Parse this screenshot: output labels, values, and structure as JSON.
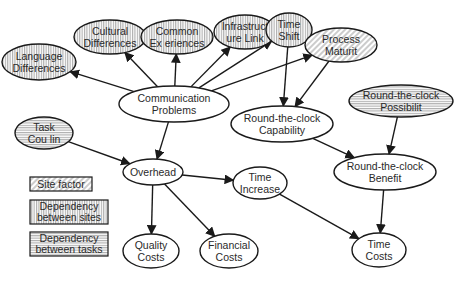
{
  "diagram": {
    "type": "causal-graph",
    "nodes": [
      {
        "id": "language",
        "line1": "Language",
        "line2": "Differences",
        "category": "sites",
        "cx": 39,
        "cy": 62,
        "rx": 37,
        "ry": 18
      },
      {
        "id": "cultural",
        "line1": "Cultural",
        "line2": "Differences",
        "category": "sites",
        "cx": 110,
        "cy": 37,
        "rx": 36,
        "ry": 17
      },
      {
        "id": "common",
        "line1": "Common",
        "line2": "Ex  eriences",
        "category": "sites",
        "cx": 177,
        "cy": 37,
        "rx": 36,
        "ry": 17
      },
      {
        "id": "infra",
        "line1": "Infrastruct",
        "line2": "ure Link",
        "category": "sites",
        "cx": 245,
        "cy": 32,
        "rx": 31,
        "ry": 17
      },
      {
        "id": "timeshift",
        "line1": "Time",
        "line2": "Shift",
        "category": "sites",
        "cx": 289,
        "cy": 30,
        "rx": 23,
        "ry": 17
      },
      {
        "id": "process",
        "line1": "Process",
        "line2": "Maturit",
        "category": "site",
        "cx": 341,
        "cy": 45,
        "rx": 36,
        "ry": 17
      },
      {
        "id": "comm",
        "line1": "Communication",
        "line2": "Problems",
        "category": "plain",
        "cx": 174,
        "cy": 104,
        "rx": 55,
        "ry": 18
      },
      {
        "id": "rtc_cap",
        "line1": "Round-the-clock",
        "line2": "Capability",
        "category": "plain",
        "cx": 282,
        "cy": 124,
        "rx": 51,
        "ry": 18
      },
      {
        "id": "rtc_pos",
        "line1": "Round-the-clock",
        "line2": "Possibilit",
        "category": "tasks",
        "cx": 401,
        "cy": 101,
        "rx": 52,
        "ry": 16
      },
      {
        "id": "task",
        "line1": "Task",
        "line2": "Cou  lin",
        "category": "tasks",
        "cx": 44,
        "cy": 133,
        "rx": 29,
        "ry": 16
      },
      {
        "id": "overhead",
        "line1": "Overhead",
        "line2": "",
        "category": "plain",
        "cx": 153,
        "cy": 172,
        "rx": 30,
        "ry": 13
      },
      {
        "id": "timeinc",
        "line1": "Time",
        "line2": "Increase",
        "category": "plain",
        "cx": 260,
        "cy": 183,
        "rx": 27,
        "ry": 16
      },
      {
        "id": "rtc_ben",
        "line1": "Round-the-clock",
        "line2": "Benefit",
        "category": "plain",
        "cx": 385,
        "cy": 172,
        "rx": 51,
        "ry": 18
      },
      {
        "id": "quality",
        "line1": "Quality",
        "line2": "Costs",
        "category": "plain",
        "cx": 151,
        "cy": 251,
        "rx": 28,
        "ry": 17
      },
      {
        "id": "financial",
        "line1": "Financial",
        "line2": "Costs",
        "category": "plain",
        "cx": 229,
        "cy": 251,
        "rx": 29,
        "ry": 17
      },
      {
        "id": "timecosts",
        "line1": "Time",
        "line2": "Costs",
        "category": "plain",
        "cx": 379,
        "cy": 250,
        "rx": 27,
        "ry": 17
      }
    ],
    "edges": [
      {
        "from": "comm",
        "to": "language"
      },
      {
        "from": "comm",
        "to": "cultural"
      },
      {
        "from": "comm",
        "to": "common"
      },
      {
        "from": "comm",
        "to": "infra"
      },
      {
        "from": "comm",
        "to": "timeshift"
      },
      {
        "from": "comm",
        "to": "process"
      },
      {
        "from": "timeshift",
        "to": "rtc_cap"
      },
      {
        "from": "process",
        "to": "rtc_cap"
      },
      {
        "from": "comm",
        "to": "overhead"
      },
      {
        "from": "task",
        "to": "overhead"
      },
      {
        "from": "overhead",
        "to": "timeinc"
      },
      {
        "from": "overhead",
        "to": "quality"
      },
      {
        "from": "overhead",
        "to": "financial"
      },
      {
        "from": "rtc_cap",
        "to": "rtc_ben"
      },
      {
        "from": "rtc_pos",
        "to": "rtc_ben"
      },
      {
        "from": "rtc_ben",
        "to": "timecosts"
      },
      {
        "from": "timeinc",
        "to": "timecosts"
      }
    ]
  },
  "legend": {
    "items": [
      {
        "id": "site",
        "line1": "Site factor",
        "line2": "",
        "pattern": "diagonal"
      },
      {
        "id": "sites",
        "line1": "Dependency",
        "line2": "between sites",
        "pattern": "vertical"
      },
      {
        "id": "tasks",
        "line1": "Dependency",
        "line2": "between tasks",
        "pattern": "horizontal"
      }
    ]
  },
  "colors": {
    "stroke": "#1a1a1a",
    "hatch": "#9a9a9a",
    "background": "#ffffff",
    "text": "#2a2a2a"
  }
}
